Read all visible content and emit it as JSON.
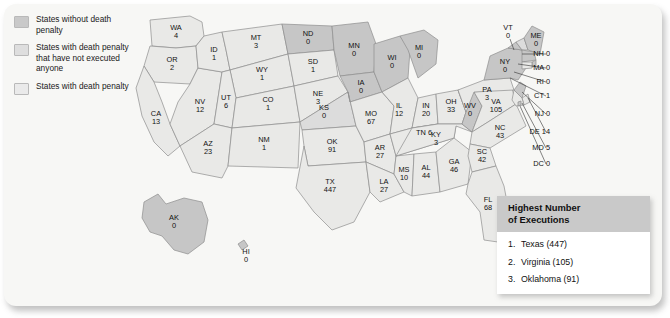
{
  "legend": {
    "items": [
      {
        "key": "none",
        "label": "States without death penalty",
        "color": "#c6c6c6"
      },
      {
        "key": "notexec",
        "label": "States with death penalty that have not executed anyone",
        "color": "#dcdcdc"
      },
      {
        "key": "dp",
        "label": "States with death penalty",
        "color": "#e9e9e7"
      }
    ]
  },
  "infobox": {
    "title_line1": "Highest Number",
    "title_line2": "of Executions",
    "entries": [
      {
        "rank": "1.",
        "text": "Texas (447)"
      },
      {
        "rank": "2.",
        "text": "Virginia (105)"
      },
      {
        "rank": "3.",
        "text": "Oklahoma (91)"
      }
    ]
  },
  "chart_data": {
    "type": "map",
    "value_label": "Number of executions",
    "categories": [
      "States without death penalty",
      "States with death penalty that have not executed anyone",
      "States with death penalty"
    ],
    "states": [
      {
        "abbr": "WA",
        "value": 4,
        "category": "dp"
      },
      {
        "abbr": "OR",
        "value": 2,
        "category": "dp"
      },
      {
        "abbr": "CA",
        "value": 13,
        "category": "dp"
      },
      {
        "abbr": "NV",
        "value": 12,
        "category": "dp"
      },
      {
        "abbr": "ID",
        "value": 1,
        "category": "dp"
      },
      {
        "abbr": "MT",
        "value": 3,
        "category": "dp"
      },
      {
        "abbr": "WY",
        "value": 1,
        "category": "dp"
      },
      {
        "abbr": "UT",
        "value": 6,
        "category": "dp"
      },
      {
        "abbr": "AZ",
        "value": 23,
        "category": "dp"
      },
      {
        "abbr": "NM",
        "value": 1,
        "category": "dp"
      },
      {
        "abbr": "CO",
        "value": 1,
        "category": "dp"
      },
      {
        "abbr": "ND",
        "value": 0,
        "category": "none"
      },
      {
        "abbr": "SD",
        "value": 1,
        "category": "dp"
      },
      {
        "abbr": "NE",
        "value": 3,
        "category": "dp"
      },
      {
        "abbr": "KS",
        "value": 0,
        "category": "notexec"
      },
      {
        "abbr": "OK",
        "value": 91,
        "category": "dp"
      },
      {
        "abbr": "TX",
        "value": 447,
        "category": "dp"
      },
      {
        "abbr": "MN",
        "value": 0,
        "category": "none"
      },
      {
        "abbr": "IA",
        "value": 0,
        "category": "none"
      },
      {
        "abbr": "MO",
        "value": 67,
        "category": "dp"
      },
      {
        "abbr": "AR",
        "value": 27,
        "category": "dp"
      },
      {
        "abbr": "LA",
        "value": 27,
        "category": "dp"
      },
      {
        "abbr": "WI",
        "value": 0,
        "category": "none"
      },
      {
        "abbr": "IL",
        "value": 12,
        "category": "dp"
      },
      {
        "abbr": "MS",
        "value": 10,
        "category": "dp"
      },
      {
        "abbr": "MI",
        "value": 0,
        "category": "none"
      },
      {
        "abbr": "IN",
        "value": 20,
        "category": "dp"
      },
      {
        "abbr": "TN",
        "value": 6,
        "category": "dp"
      },
      {
        "abbr": "AL",
        "value": 44,
        "category": "dp"
      },
      {
        "abbr": "OH",
        "value": 33,
        "category": "dp"
      },
      {
        "abbr": "KY",
        "value": 3,
        "category": "dp"
      },
      {
        "abbr": "GA",
        "value": 46,
        "category": "dp"
      },
      {
        "abbr": "WV",
        "value": 0,
        "category": "none"
      },
      {
        "abbr": "VA",
        "value": 105,
        "category": "dp"
      },
      {
        "abbr": "NC",
        "value": 43,
        "category": "dp"
      },
      {
        "abbr": "SC",
        "value": 42,
        "category": "dp"
      },
      {
        "abbr": "FL",
        "value": 68,
        "category": "dp"
      },
      {
        "abbr": "PA",
        "value": 3,
        "category": "dp"
      },
      {
        "abbr": "NY",
        "value": 0,
        "category": "none"
      },
      {
        "abbr": "VT",
        "value": 0,
        "category": "none"
      },
      {
        "abbr": "ME",
        "value": 0,
        "category": "none"
      },
      {
        "abbr": "NH",
        "value": 0,
        "category": "notexec"
      },
      {
        "abbr": "MA",
        "value": 0,
        "category": "none"
      },
      {
        "abbr": "RI",
        "value": 0,
        "category": "none"
      },
      {
        "abbr": "CT",
        "value": 1,
        "category": "dp"
      },
      {
        "abbr": "NJ",
        "value": 0,
        "category": "none"
      },
      {
        "abbr": "DE",
        "value": 14,
        "category": "dp"
      },
      {
        "abbr": "MD",
        "value": 5,
        "category": "dp"
      },
      {
        "abbr": "DC",
        "value": 0,
        "category": "none"
      },
      {
        "abbr": "AK",
        "value": 0,
        "category": "none"
      },
      {
        "abbr": "HI",
        "value": 0,
        "category": "none"
      }
    ],
    "labels": {
      "WA": "WA\n4",
      "OR": "OR\n2",
      "CA": "CA\n13",
      "NV": "NV\n12",
      "ID": "ID\n1",
      "MT": "MT\n3",
      "WY": "WY\n1",
      "UT": "UT\n6",
      "AZ": "AZ\n23",
      "NM": "NM\n1",
      "CO": "CO\n1",
      "ND": "ND\n0",
      "SD": "SD\n1",
      "NE": "NE\n3",
      "KS": "KS\n0",
      "OK": "OK\n91",
      "TX": "TX\n447",
      "MN": "MN\n0",
      "IA": "IA\n0",
      "MO": "MO\n67",
      "AR": "AR\n27",
      "LA": "LA\n27",
      "WI": "WI\n0",
      "IL": "IL\n12",
      "MS": "MS\n10",
      "MI": "MI\n0",
      "IN": "IN\n20",
      "TN": "TN 6",
      "AL": "AL\n44",
      "OH": "OH\n33",
      "KY": "KY\n3",
      "GA": "GA\n46",
      "WV": "WV\n0",
      "VA": "VA\n105",
      "NC": "NC\n43",
      "SC": "SC\n42",
      "FL": "FL\n68",
      "PA": "PA\n3",
      "NY": "NY\n0",
      "VT": "VT\n0",
      "ME": "ME\n0",
      "NH": "NH 0",
      "MA": "MA 0",
      "RI": "RI 0",
      "CT": "CT 1",
      "NJ": "NJ 0",
      "DE": "DE 14",
      "MD": "MD 5",
      "DC": "DC 0",
      "AK": "AK\n0",
      "HI": "HI\n0"
    }
  }
}
